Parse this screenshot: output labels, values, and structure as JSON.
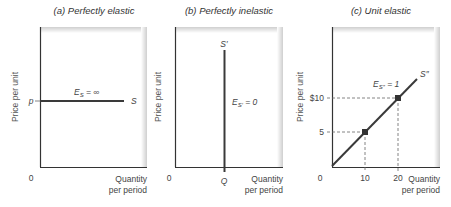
{
  "panels": [
    {
      "id": "a",
      "title": "(a) Perfectly elastic",
      "y_axis_label": "Price per unit",
      "x_axis_label_line1": "Quantity",
      "x_axis_label_line2": "per period",
      "origin_label": "0",
      "price_label": "p",
      "curve_label": "S",
      "elasticity_label_main": "E",
      "elasticity_label_sub": "S",
      "elasticity_label_rest": " = ∞"
    },
    {
      "id": "b",
      "title": "(b) Perfectly inelastic",
      "y_axis_label": "Price per unit",
      "x_axis_label_line1": "Quantity",
      "x_axis_label_line2": "per period",
      "origin_label": "0",
      "quantity_label": "Q",
      "curve_label": "S′",
      "elasticity_label_main": "E",
      "elasticity_label_sub": "S′",
      "elasticity_label_rest": " = 0"
    },
    {
      "id": "c",
      "title": "(c) Unit elastic",
      "y_axis_label": "Price per unit",
      "x_axis_label_line1": "Quantity",
      "x_axis_label_line2": "per period",
      "origin_label": "0",
      "curve_label": "S″",
      "elasticity_label_main": "E",
      "elasticity_label_sub": "S″",
      "elasticity_label_rest": " = 1",
      "y_ticks": [
        "$10",
        "5"
      ],
      "x_ticks": [
        "10",
        "20"
      ]
    }
  ],
  "colors": {
    "axis": "#333333",
    "curve": "#3a3a3a",
    "frame_shade": "#d4d4d4",
    "dashed": "#666666"
  }
}
